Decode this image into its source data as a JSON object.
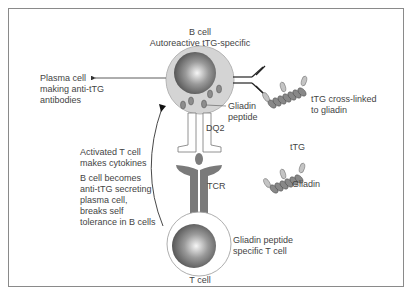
{
  "diagram": {
    "type": "immunology-schematic",
    "b_cell": {
      "title": "B cell",
      "subtitle": "Autoreactive tTG-specific"
    },
    "plasma_cell_label": [
      "Plasma cell",
      "making anti-tTG",
      "antibodies"
    ],
    "gliadin_peptide_label": [
      "Gliadin",
      "peptide"
    ],
    "dq2_label": "DQ2",
    "tcr_label": "TCR",
    "tTG_crosslinked_label": [
      "tTG cross-linked",
      "to gliadin"
    ],
    "free_complex": {
      "ttg_label": "tTG",
      "gliadin_label": "Gliadin"
    },
    "activated_t_cell_label": [
      "Activated T cell",
      "makes cytokines"
    ],
    "b_cell_becomes_label": [
      "B cell becomes",
      "anti-tTG secreting",
      "plasma cell,",
      "breaks self",
      "tolerance in B cells"
    ],
    "t_cell_spec_label": [
      "Gliadin peptide",
      "specific T cell"
    ],
    "t_cell_title": "T cell",
    "colors": {
      "frame": "#8a8a8a",
      "cytoplasm": "#d3d3d3",
      "nucleus_dark": "#555555",
      "nucleus_light": "#f5f5f5",
      "receptor_dark": "#7a7a7a",
      "peptide": "#8c8c8c",
      "line": "#333333"
    }
  }
}
